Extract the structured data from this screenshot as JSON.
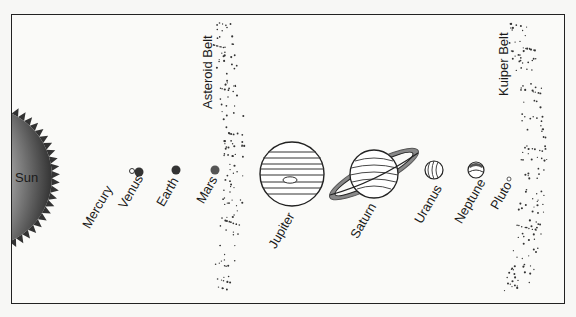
{
  "diagram": {
    "labels": {
      "sun": "Sun",
      "asteroid_belt": "Asteroid Belt",
      "kuiper_belt": "Kuiper Belt"
    },
    "planets": [
      {
        "name": "Mercury"
      },
      {
        "name": "Venus"
      },
      {
        "name": "Earth"
      },
      {
        "name": "Mars"
      },
      {
        "name": "Jupiter"
      },
      {
        "name": "Saturn"
      },
      {
        "name": "Uranus"
      },
      {
        "name": "Neptune"
      },
      {
        "name": "Pluto"
      }
    ]
  }
}
